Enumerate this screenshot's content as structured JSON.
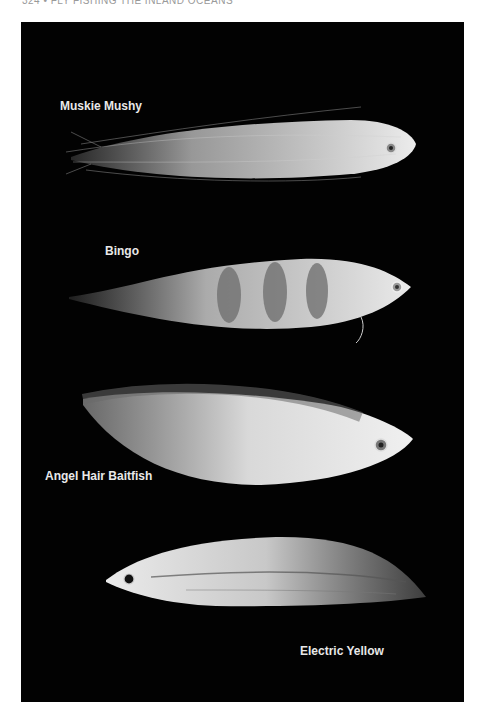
{
  "page": {
    "running_head": "324 • FLY FISHING THE INLAND OCEANS"
  },
  "photo": {
    "background_color": "#020202",
    "flies": [
      {
        "name": "Muskie Mushy",
        "label_position": "above-left",
        "eye": "right"
      },
      {
        "name": "Bingo",
        "label_position": "above-left",
        "eye": "right",
        "pattern": "dark vertical bars"
      },
      {
        "name": "Angel Hair Baitfish",
        "label_position": "below-left",
        "eye": "right"
      },
      {
        "name": "Electric Yellow",
        "label_position": "below-right",
        "eye": "left"
      }
    ]
  }
}
